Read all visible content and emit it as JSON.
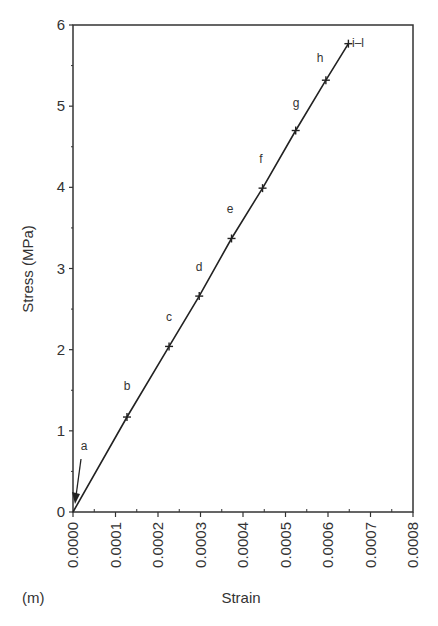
{
  "chart_data": {
    "type": "line",
    "title": "",
    "panel_label": "(m)",
    "xlabel": "Strain",
    "ylabel": "Stress (MPa)",
    "xlim": [
      0,
      0.0008
    ],
    "ylim": [
      0,
      6
    ],
    "x_ticks": [
      "0.0000",
      "0.0001",
      "0.0002",
      "0.0003",
      "0.0004",
      "0.0005",
      "0.0006",
      "0.0007",
      "0.0008"
    ],
    "y_ticks": [
      "0",
      "1",
      "2",
      "3",
      "4",
      "5",
      "6"
    ],
    "grid": false,
    "legend": null,
    "series": [
      {
        "name": "stress-strain",
        "x": [
          0.0,
          0.000127,
          0.000226,
          0.000297,
          0.000373,
          0.000446,
          0.000524,
          0.000595,
          0.000648
        ],
        "y": [
          0.0,
          1.17,
          2.04,
          2.66,
          3.37,
          3.99,
          4.7,
          5.32,
          5.77
        ]
      }
    ],
    "point_labels": [
      {
        "label": "a",
        "x": 5e-06,
        "y": 0.25,
        "note": "arrow pointing to origin"
      },
      {
        "label": "b",
        "x": 0.000127,
        "y": 1.17
      },
      {
        "label": "c",
        "x": 0.000226,
        "y": 2.04
      },
      {
        "label": "d",
        "x": 0.000297,
        "y": 2.66
      },
      {
        "label": "e",
        "x": 0.000373,
        "y": 3.37
      },
      {
        "label": "f",
        "x": 0.000446,
        "y": 3.99
      },
      {
        "label": "g",
        "x": 0.000524,
        "y": 4.7
      },
      {
        "label": "h",
        "x": 0.000595,
        "y": 5.32
      },
      {
        "label": "i–l",
        "x": 0.000648,
        "y": 5.77
      }
    ]
  }
}
